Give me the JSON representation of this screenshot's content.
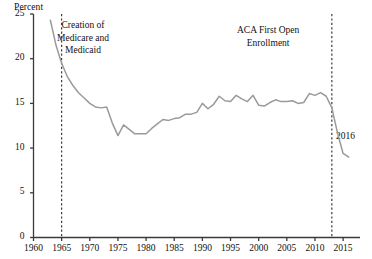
{
  "chart_data": {
    "type": "line",
    "title": "",
    "subtitle": "",
    "xlabel": "",
    "ylabel": "Percent",
    "xlim": [
      1960,
      2018
    ],
    "ylim": [
      0,
      25
    ],
    "grid": false,
    "legend_position": "none",
    "line_color": "#9a9a9a",
    "axis_color": "#3a3a3a",
    "text_color": "#111111",
    "y_ticks": [
      0,
      5,
      10,
      15,
      20,
      25
    ],
    "y_tick_labels": [
      "0",
      "5",
      "10",
      "15",
      "20",
      "25"
    ],
    "x_ticks": [
      1960,
      1965,
      1970,
      1975,
      1980,
      1985,
      1990,
      1995,
      2000,
      2005,
      2010,
      2015
    ],
    "x_tick_labels": [
      "1960",
      "1965",
      "1970",
      "1975",
      "1980",
      "1985",
      "1990",
      "1995",
      "2000",
      "2005",
      "2010",
      "2015"
    ],
    "series": [
      {
        "name": "Uninsured rate",
        "x": [
          1963,
          1964,
          1965,
          1966,
          1967,
          1968,
          1969,
          1970,
          1971,
          1972,
          1973,
          1974,
          1975,
          1976,
          1977,
          1978,
          1979,
          1980,
          1981,
          1982,
          1983,
          1984,
          1985,
          1986,
          1987,
          1988,
          1989,
          1990,
          1991,
          1992,
          1993,
          1994,
          1995,
          1996,
          1997,
          1998,
          1999,
          2000,
          2001,
          2002,
          2003,
          2004,
          2005,
          2006,
          2007,
          2008,
          2009,
          2010,
          2011,
          2012,
          2013,
          2014,
          2015,
          2016
        ],
        "values": [
          24.3,
          21.5,
          19.5,
          18.0,
          17.0,
          16.2,
          15.6,
          15.0,
          14.6,
          14.5,
          14.6,
          12.8,
          11.4,
          12.6,
          12.1,
          11.6,
          11.6,
          11.6,
          12.2,
          12.7,
          13.2,
          13.1,
          13.3,
          13.4,
          13.8,
          13.8,
          14.0,
          15.0,
          14.4,
          14.9,
          15.8,
          15.3,
          15.2,
          15.9,
          15.5,
          15.2,
          15.9,
          14.8,
          14.7,
          15.1,
          15.4,
          15.2,
          15.2,
          15.3,
          15.0,
          15.1,
          16.1,
          15.9,
          16.2,
          15.8,
          14.5,
          11.7,
          9.4,
          9.0
        ]
      }
    ],
    "annotations": [
      {
        "name": "medicare-medicaid",
        "lines": [
          "Creation of",
          "Medicare and",
          "Medicaid"
        ],
        "marker_x": 1965,
        "marker_type": "vertical-dashed-line"
      },
      {
        "name": "aca-first-open-enrollment",
        "lines": [
          "ACA First Open",
          "Enrollment"
        ],
        "marker_x": 2013,
        "marker_type": "vertical-dashed-line"
      },
      {
        "name": "endpoint-year",
        "lines": [
          "2016"
        ],
        "marker_x": 2016,
        "marker_type": "point-label"
      }
    ]
  }
}
